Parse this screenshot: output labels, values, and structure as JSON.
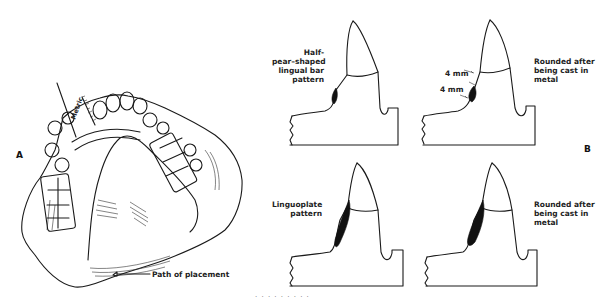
{
  "figure": {
    "panels": [
      {
        "id": "A",
        "letter": "A",
        "description": "Maxillary cast with partial denture framework, surveyed with metric ruler",
        "labels": {
          "ruler": "Metric",
          "path": "Path of placement"
        }
      },
      {
        "id": "B",
        "letter": "B",
        "description": "Cross-sections of anterior tooth showing lingual bar and linguoplate patterns",
        "sections": [
          {
            "position": "top-left",
            "label": "Half-\npear–shaped\nlingual bar\npattern"
          },
          {
            "position": "top-right",
            "label": "Rounded after\nbeing cast in\nmetal",
            "dimensions": [
              "4 mm",
              "4 mm"
            ]
          },
          {
            "position": "bottom-left",
            "label": "Linguoplate\npattern"
          },
          {
            "position": "bottom-right",
            "label": "Rounded after\nbeing cast in\nmetal"
          }
        ]
      }
    ],
    "caption_fragment": "· · · · · · · · ·"
  },
  "colors": {
    "ink": "#1a1a1a",
    "background": "#ffffff"
  }
}
